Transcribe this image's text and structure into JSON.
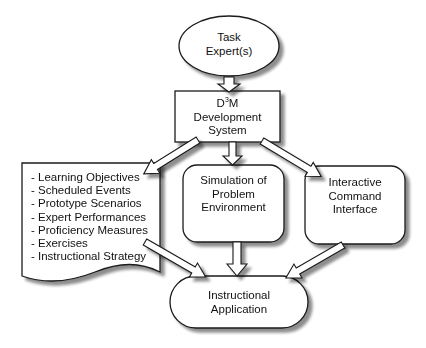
{
  "diagram": {
    "nodes": {
      "task_expert": {
        "label_line1": "Task",
        "label_line2": "Expert(s)",
        "shape": "ellipse"
      },
      "d3m": {
        "label_prefix": "D",
        "label_sup": "3",
        "label_suffix": "M",
        "label_line2": "Development",
        "label_line3": "System",
        "shape": "rectangle"
      },
      "document": {
        "shape": "document",
        "items": [
          "- Learning Objectives",
          "- Scheduled Events",
          "- Prototype Scenarios",
          "- Expert Performances",
          "- Proficiency Measures",
          "- Exercises",
          "- Instructional Strategy"
        ]
      },
      "simulation": {
        "label_line1": "Simulation of",
        "label_line2": "Problem",
        "label_line3": "Environment",
        "shape": "rounded-rectangle"
      },
      "interface": {
        "label_line1": "Interactive",
        "label_line2": "Command",
        "label_line3": "Interface",
        "shape": "rounded-rectangle"
      },
      "application": {
        "label_line1": "Instructional",
        "label_line2": "Application",
        "shape": "stadium"
      }
    },
    "edges": [
      {
        "from": "task_expert",
        "to": "d3m"
      },
      {
        "from": "d3m",
        "to": "document"
      },
      {
        "from": "d3m",
        "to": "simulation"
      },
      {
        "from": "d3m",
        "to": "interface"
      },
      {
        "from": "document",
        "to": "application"
      },
      {
        "from": "simulation",
        "to": "application"
      },
      {
        "from": "interface",
        "to": "application"
      }
    ],
    "colors": {
      "stroke": "#1a1a1a",
      "fill": "#ffffff",
      "shadow": "#9a9a9a"
    }
  }
}
